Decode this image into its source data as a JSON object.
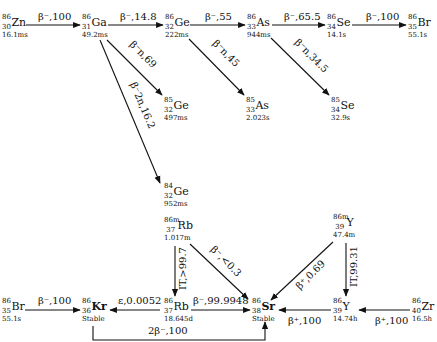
{
  "nuclides": [
    {
      "id": "zn86",
      "A": "86",
      "Z": "30",
      "el": "Zn",
      "hl": "16.1ms",
      "x": 2,
      "y": 14
    },
    {
      "id": "ga86",
      "A": "86",
      "Z": "31",
      "el": "Ga",
      "hl": "49.2ms",
      "x": 82,
      "y": 14
    },
    {
      "id": "ge86",
      "A": "86",
      "Z": "32",
      "el": "Ge",
      "hl": "222ms",
      "x": 165,
      "y": 14
    },
    {
      "id": "as86",
      "A": "86",
      "Z": "33",
      "el": "As",
      "hl": "944ms",
      "x": 247,
      "y": 14
    },
    {
      "id": "se86",
      "A": "86",
      "Z": "34",
      "el": "Se",
      "hl": "14.1s",
      "x": 327,
      "y": 14
    },
    {
      "id": "br86top",
      "A": "86",
      "Z": "35",
      "el": "Br",
      "hl": "55.1s",
      "x": 408,
      "y": 14
    },
    {
      "id": "ge85",
      "A": "85",
      "Z": "32",
      "el": "Ge",
      "hl": "497ms",
      "x": 164,
      "y": 97
    },
    {
      "id": "as85",
      "A": "85",
      "Z": "33",
      "el": "As",
      "hl": "2.023s",
      "x": 246,
      "y": 97
    },
    {
      "id": "se85",
      "A": "85",
      "Z": "34",
      "el": "Se",
      "hl": "32.9s",
      "x": 331,
      "y": 97
    },
    {
      "id": "ge84",
      "A": "84",
      "Z": "32",
      "el": "Ge",
      "hl": "952ms",
      "x": 164,
      "y": 183
    },
    {
      "id": "rb86m",
      "A": "86m",
      "Z": "37",
      "el": "Rb",
      "hl": "1.017m",
      "x": 164,
      "y": 217
    },
    {
      "id": "y86m",
      "A": "86m",
      "Z": "39",
      "el": "Y",
      "hl": "47.4m",
      "x": 333,
      "y": 214
    },
    {
      "id": "br86",
      "A": "86",
      "Z": "35",
      "el": "Br",
      "hl": "55.1s",
      "x": 2,
      "y": 298
    },
    {
      "id": "kr86",
      "A": "86",
      "Z": "36",
      "el": "Kr",
      "hl": "Stable",
      "x": 82,
      "y": 298,
      "bold": true
    },
    {
      "id": "rb86",
      "A": "86",
      "Z": "37",
      "el": "Rb",
      "hl": "18.645d",
      "x": 164,
      "y": 298
    },
    {
      "id": "sr86",
      "A": "86",
      "Z": "38",
      "el": "Sr",
      "hl": "Stable",
      "x": 252,
      "y": 298,
      "bold": true
    },
    {
      "id": "y86",
      "A": "86",
      "Z": "39",
      "el": "Y",
      "hl": "14.74h",
      "x": 333,
      "y": 298
    },
    {
      "id": "zr86",
      "A": "86",
      "Z": "40",
      "el": "Zr",
      "hl": "16.5h",
      "x": 412,
      "y": 298
    }
  ],
  "decays": [
    {
      "from": "Zn-86",
      "to": "Ga-86",
      "label": "β⁻,100"
    },
    {
      "from": "Ga-86",
      "to": "Ge-86",
      "label": "β⁻,14.8"
    },
    {
      "from": "Ge-86",
      "to": "As-86",
      "label": "β⁻,55"
    },
    {
      "from": "As-86",
      "to": "Se-86",
      "label": "β⁻,65.5"
    },
    {
      "from": "Se-86",
      "to": "Br-86",
      "label": "β⁻,100"
    },
    {
      "from": "Ga-86",
      "to": "Ge-85",
      "label": "β⁻n,69"
    },
    {
      "from": "Ga-86",
      "to": "Ge-84",
      "label": "β⁻2n,16.2"
    },
    {
      "from": "Ge-86",
      "to": "As-85",
      "label": "β⁻n,45"
    },
    {
      "from": "As-86",
      "to": "Se-85",
      "label": "β⁻n,34.5"
    },
    {
      "from": "Rb-86m",
      "to": "Rb-86",
      "label": "IT,>99.7"
    },
    {
      "from": "Rb-86m",
      "to": "Sr-86",
      "label": "β⁻,<0.3"
    },
    {
      "from": "Y-86m",
      "to": "Sr-86",
      "label": "β⁺,0.69"
    },
    {
      "from": "Y-86m",
      "to": "Y-86",
      "label": "IT,99.31"
    },
    {
      "from": "Br-86",
      "to": "Kr-86",
      "label": "β⁻,100"
    },
    {
      "from": "Rb-86",
      "to": "Kr-86",
      "label": "ε,0.0052"
    },
    {
      "from": "Rb-86",
      "to": "Sr-86",
      "label": "β⁻,99.9948"
    },
    {
      "from": "Y-86",
      "to": "Sr-86",
      "label": "β⁺,100"
    },
    {
      "from": "Zr-86",
      "to": "Y-86",
      "label": "β⁺,100"
    },
    {
      "from": "Kr-86",
      "to": "Sr-86",
      "label": "2β⁻,100"
    }
  ]
}
